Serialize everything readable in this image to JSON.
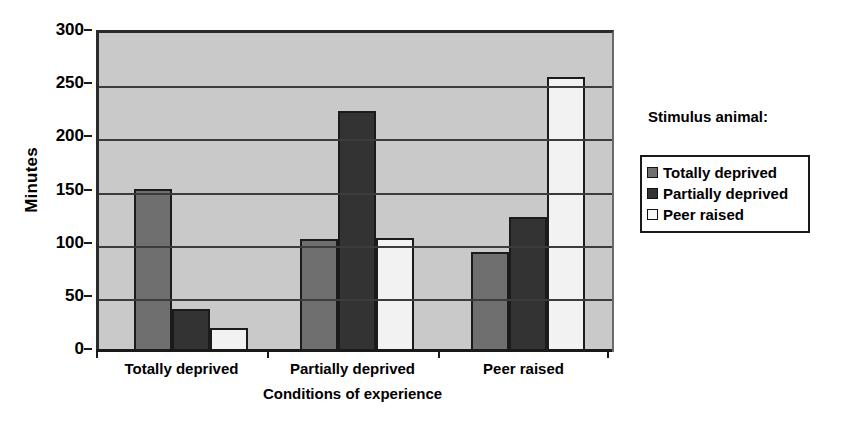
{
  "chart_data": {
    "type": "bar",
    "title": "",
    "xlabel": "Conditions of experience",
    "ylabel": "Minutes",
    "ylim": [
      0,
      300
    ],
    "ytick_step": 50,
    "yticks": [
      0,
      50,
      100,
      150,
      200,
      250,
      300
    ],
    "grid": true,
    "legend_position": "right",
    "legend_title": "Stimulus animal:",
    "categories": [
      "Totally deprived",
      "Partially deprived",
      "Peer raised"
    ],
    "series": [
      {
        "name": "Totally deprived",
        "color": "#6f6f6f",
        "values": [
          153,
          106,
          94
        ]
      },
      {
        "name": "Partially deprived",
        "color": "#333333",
        "values": [
          40,
          227,
          127
        ]
      },
      {
        "name": "Peer raised",
        "color": "#f2f2f2",
        "values": [
          23,
          107,
          259
        ]
      }
    ],
    "plot_background": "#c9c9c9",
    "axis_color": "#1a1a1a"
  },
  "axes": {
    "y_title": "Minutes",
    "x_title": "Conditions of experience",
    "y_tick_labels": [
      "300",
      "250",
      "200",
      "150",
      "100",
      "50",
      "0"
    ],
    "x_tick_labels": [
      "Totally deprived",
      "Partially deprived",
      "Peer raised"
    ]
  },
  "legend": {
    "title": "Stimulus animal:",
    "items": [
      {
        "label": "Totally deprived",
        "color": "#6f6f6f"
      },
      {
        "label": "Partially deprived",
        "color": "#333333"
      },
      {
        "label": "Peer raised",
        "color": "#f7f7f7"
      }
    ]
  }
}
